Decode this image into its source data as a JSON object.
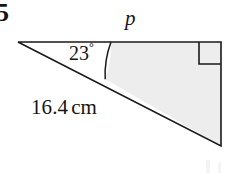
{
  "figure": {
    "question_number": "5",
    "labels": {
      "side_top": "p",
      "angle": "23",
      "degree_symbol": "°",
      "hypotenuse_value": "16.4",
      "hypotenuse_unit": "cm"
    },
    "colors": {
      "stroke": "#1a1a1a",
      "shade_fill": "#ededed",
      "background": "#ffffff",
      "text": "#151515"
    },
    "geometry": {
      "apex_left": [
        18,
        42
      ],
      "top_right": [
        221,
        42
      ],
      "bottom_right": [
        221,
        146
      ],
      "arc_top_point": [
        111,
        42
      ],
      "arc_bottom_point": [
        105,
        79
      ],
      "right_angle_marker": {
        "x": 197,
        "y": 42,
        "size": 22
      },
      "stroke_width": 1.6
    }
  }
}
